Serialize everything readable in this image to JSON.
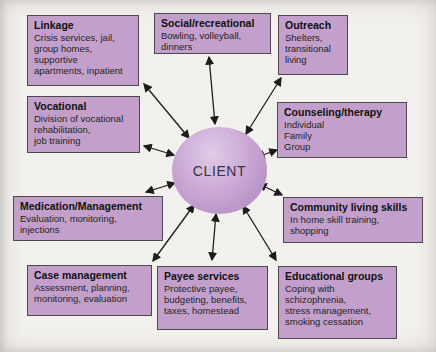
{
  "diagram": {
    "center_label": "CLIENT",
    "nodes": [
      {
        "id": "linkage",
        "title": "Linkage",
        "body": "Crisis services, jail,\ngroup homes,\nsupportive\napartments, inpatient"
      },
      {
        "id": "social-recreational",
        "title": "Social/recreational",
        "body": "Bowling, volleyball,\ndinners"
      },
      {
        "id": "outreach",
        "title": "Outreach",
        "body": "Shelters,\ntransitional\nliving"
      },
      {
        "id": "vocational",
        "title": "Vocational",
        "body": "Division of vocational\nrehabilitation,\njob training"
      },
      {
        "id": "counseling-therapy",
        "title": "Counseling/therapy",
        "body": "Individual\nFamily\nGroup"
      },
      {
        "id": "medication-management",
        "title": "Medication/Management",
        "body": "Evaluation, monitoring,\ninjections"
      },
      {
        "id": "community-living-skills",
        "title": "Community living skills",
        "body": "In home skill training,\nshopping"
      },
      {
        "id": "case-management",
        "title": "Case management",
        "body": "Assessment, planning,\nmonitoring, evaluation"
      },
      {
        "id": "payee-services",
        "title": "Payee services",
        "body": "Protective payee,\nbudgeting, benefits,\ntaxes, homestead"
      },
      {
        "id": "educational-groups",
        "title": "Educational groups",
        "body": "Coping with\nschizophrenia,\nstress management,\nsmoking cessation"
      }
    ],
    "colors": {
      "box_fill": "#c3a0cb",
      "box_border": "#4a4a4a",
      "circle_light": "#e0cce7",
      "circle_mid": "#c5a2d1",
      "circle_dark": "#a983bd",
      "arrow": "#1c1c1c",
      "background": "#f3f1ed"
    }
  }
}
